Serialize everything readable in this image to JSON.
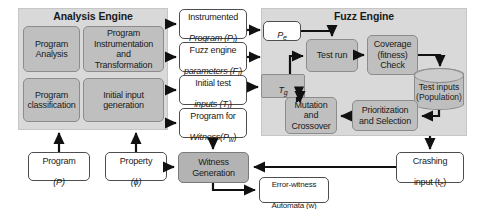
{
  "diagram": {
    "panels": [
      {
        "id": "analysis-engine",
        "label": "Analysis Engine"
      },
      {
        "id": "fuzz-engine",
        "label": "Fuzz Engine"
      }
    ],
    "analysis_engine": {
      "label": "Analysis Engine",
      "boxes": [
        {
          "id": "program-analysis",
          "label": "Program\nAnalysis"
        },
        {
          "id": "program-instrumentation",
          "label": "Program\nInstrumentation\nand\nTransformation"
        },
        {
          "id": "program-classification",
          "label": "Program\nclassification"
        },
        {
          "id": "initial-input-generation",
          "label": "Initial input\ngeneration"
        }
      ]
    },
    "artifacts": [
      {
        "id": "instrumented-program",
        "label": "Instrumented",
        "sym": "Program (P",
        "sub": "i",
        "tail": ")"
      },
      {
        "id": "fuzz-engine-parameters",
        "label": "Fuzz engine",
        "sym": "parameters (F",
        "sub": "i",
        "tail": ")"
      },
      {
        "id": "initial-test-inputs",
        "label": "Initial test",
        "sym": "inputs (T",
        "sub": "i",
        "tail": ")"
      },
      {
        "id": "program-for-witness",
        "label": "Program for",
        "sym": "Witness(P",
        "sub": "w",
        "tail": ")"
      }
    ],
    "fuzz_engine": {
      "label": "Fuzz Engine",
      "pe": {
        "id": "pe-node",
        "sym": "P",
        "sub": "e"
      },
      "tg": {
        "id": "tg-node",
        "sym": "T",
        "sub": "g"
      },
      "boxes": [
        {
          "id": "test-run",
          "label": "Test run"
        },
        {
          "id": "coverage-fitness-check",
          "label": "Coverage\n(fitness)\nCheck"
        },
        {
          "id": "prioritization-and-selection",
          "label": "Prioritization\nand Selection"
        },
        {
          "id": "mutation-and-crossover",
          "label": "Mutation\nand\nCrossover"
        }
      ],
      "store": {
        "id": "test-inputs-population",
        "label": "Test inputs\n(Population)"
      }
    },
    "inputs": [
      {
        "id": "program-input",
        "label": "Program",
        "sym": "(P)"
      },
      {
        "id": "property-input",
        "label": "Property",
        "sym": "(ϕ)"
      }
    ],
    "outputs": {
      "witness_generation": {
        "id": "witness-generation",
        "label": "Witness\nGeneration"
      },
      "error_witness_automata": {
        "id": "error-witness-automata",
        "label": "Error-witness",
        "sym": "Automata (w)"
      },
      "crashing_input": {
        "id": "crashing-input",
        "label": "Crashing",
        "sym": "input (t",
        "sub": "c",
        "tail": ")"
      }
    },
    "colors": {
      "panel_fill": "#d9d9d9",
      "box_fill": "#bfbfbf",
      "white_fill": "#ffffff",
      "stroke": "#4d4d4d",
      "text": "#1a1a1a"
    }
  }
}
